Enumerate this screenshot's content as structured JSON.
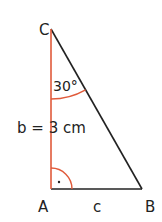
{
  "diagram": {
    "type": "right-triangle",
    "vertices": {
      "A": {
        "label": "A"
      },
      "B": {
        "label": "B"
      },
      "C": {
        "label": "C"
      }
    },
    "sides": {
      "b": {
        "label": "b = 3 cm",
        "between": "A-C",
        "color": "#e05a3a"
      },
      "c": {
        "label": "c",
        "between": "A-B",
        "color": "#222222"
      },
      "a": {
        "between": "B-C",
        "color": "#222222"
      }
    },
    "angles": {
      "C": {
        "label": "30°",
        "color": "#e05a3a"
      },
      "A": {
        "label": "·",
        "kind": "right-angle",
        "color": "#e05a3a"
      }
    }
  }
}
